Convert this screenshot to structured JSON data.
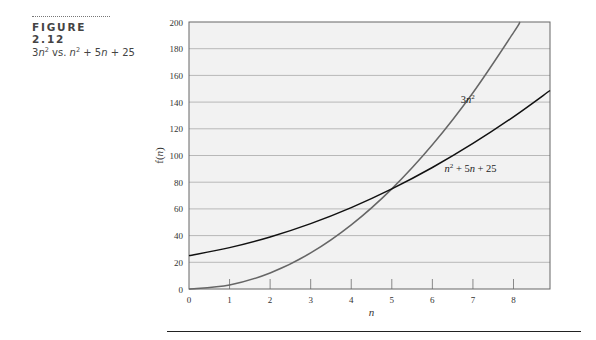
{
  "figure": {
    "label": "FIGURE 2.12",
    "subtitle_parts": [
      "3",
      "n",
      "2",
      " vs. ",
      "n",
      "2",
      " + 5",
      "n",
      " + 25"
    ]
  },
  "chart_data": {
    "type": "line",
    "xlabel": "n",
    "ylabel": "f(n)",
    "xlim": [
      0,
      8.9
    ],
    "ylim": [
      0,
      200
    ],
    "x_ticks": [
      0,
      1,
      2,
      3,
      4,
      5,
      6,
      7,
      8
    ],
    "y_ticks": [
      0,
      20,
      40,
      60,
      80,
      100,
      120,
      140,
      160,
      180,
      200
    ],
    "grid": "horizontal",
    "series": [
      {
        "name": "3n²",
        "color": "#666666",
        "x": [
          0,
          1,
          2,
          3,
          4,
          5,
          6,
          7,
          8,
          8.16
        ],
        "values": [
          0,
          3,
          12,
          27,
          48,
          75,
          108,
          147,
          192,
          200
        ]
      },
      {
        "name": "n² + 5n + 25",
        "color": "#111111",
        "x": [
          0,
          1,
          2,
          3,
          4,
          5,
          6,
          7,
          8,
          8.9
        ],
        "values": [
          25,
          31,
          39,
          49,
          61,
          75,
          91,
          109,
          129,
          148.7
        ]
      }
    ],
    "annotations": [
      {
        "text": "3n²",
        "x": 6.7,
        "y": 139
      },
      {
        "text": "n² + 5n + 25",
        "x": 6.3,
        "y": 88
      }
    ]
  }
}
